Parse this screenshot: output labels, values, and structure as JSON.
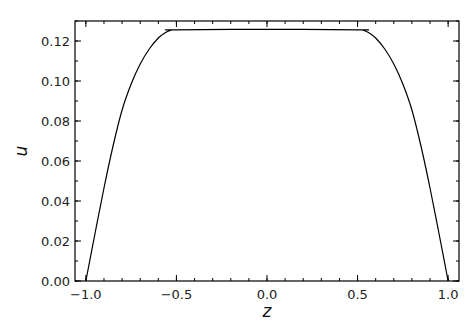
{
  "chart_data": {
    "type": "line",
    "title": "",
    "xlabel": "z",
    "ylabel": "u",
    "xlim": [
      -1.06,
      1.06
    ],
    "ylim": [
      0.0,
      0.13
    ],
    "grid": false,
    "legend": null,
    "x_ticks": [
      -1.0,
      -0.5,
      0.0,
      0.5,
      1.0
    ],
    "x_tick_labels": [
      "−1.0",
      "−0.5",
      "0.0",
      "0.5",
      "1.0"
    ],
    "x_minor_step": 0.1,
    "y_ticks": [
      0.0,
      0.02,
      0.04,
      0.06,
      0.08,
      0.1,
      0.12
    ],
    "y_tick_labels": [
      "0.00",
      "0.02",
      "0.04",
      "0.06",
      "0.08",
      "0.10",
      "0.12"
    ],
    "y_minor_step": 0.01,
    "line_color": "#000000",
    "series": [
      {
        "name": "u(z)",
        "x": [
          -1.0,
          -0.95,
          -0.9,
          -0.85,
          -0.8,
          -0.75,
          -0.7,
          -0.65,
          -0.6,
          -0.56,
          -0.53,
          -0.52,
          0.0,
          0.52,
          0.53,
          0.56,
          0.6,
          0.65,
          0.7,
          0.75,
          0.8,
          0.85,
          0.9,
          0.95,
          1.0
        ],
        "values": [
          0.0,
          0.0235,
          0.0465,
          0.0675,
          0.0855,
          0.0985,
          0.1085,
          0.116,
          0.1215,
          0.1243,
          0.1254,
          0.1256,
          0.1258,
          0.1256,
          0.1254,
          0.1243,
          0.1215,
          0.116,
          0.1085,
          0.0985,
          0.0855,
          0.0675,
          0.0465,
          0.0235,
          0.0
        ]
      }
    ]
  }
}
